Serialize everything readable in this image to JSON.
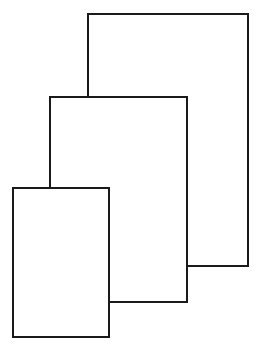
{
  "figure": {
    "width": 259,
    "height": 351,
    "background_color": "#ffffff",
    "stroke_color": "#1a1a1a",
    "stroke_width": 2,
    "fill_color": "#ffffff"
  },
  "shapes": [
    {
      "name": "large-rectangle",
      "order": "back",
      "x": 88,
      "y": 14,
      "width": 160,
      "height": 252,
      "right": 248,
      "bottom": 266,
      "occluded_by": "middle-rectangle",
      "visible_left_edge_from": 14,
      "visible_left_edge_to": 97,
      "label": "Large rectangle"
    },
    {
      "name": "middle-rectangle",
      "order": "middle",
      "x": 50,
      "y": 97,
      "width": 137,
      "height": 205,
      "right": 187,
      "bottom": 302,
      "occluded_by": "small-rectangle",
      "visible_left_edge_from": 97,
      "visible_left_edge_to": 188,
      "visible_bottom_edge_from": 109,
      "visible_bottom_edge_to": 187,
      "label": "Middle rectangle"
    },
    {
      "name": "small-rectangle",
      "order": "front",
      "x": 13,
      "y": 188,
      "width": 96,
      "height": 149,
      "right": 109,
      "bottom": 337,
      "occluded_by": null,
      "label": "Small rectangle"
    }
  ]
}
